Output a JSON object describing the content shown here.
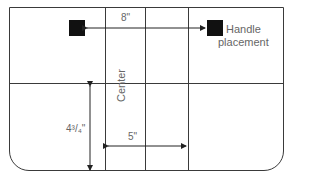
{
  "diagram": {
    "labels": {
      "handle_spacing": "8\"",
      "handle_caption_line1": "Handle",
      "handle_caption_line2": "placement",
      "center": "Center",
      "width_dim": "5\"",
      "height_dim": "4³/₄\""
    },
    "colors": {
      "line": "#3a3a3a",
      "handle": "#111111",
      "text": "#666666"
    }
  }
}
